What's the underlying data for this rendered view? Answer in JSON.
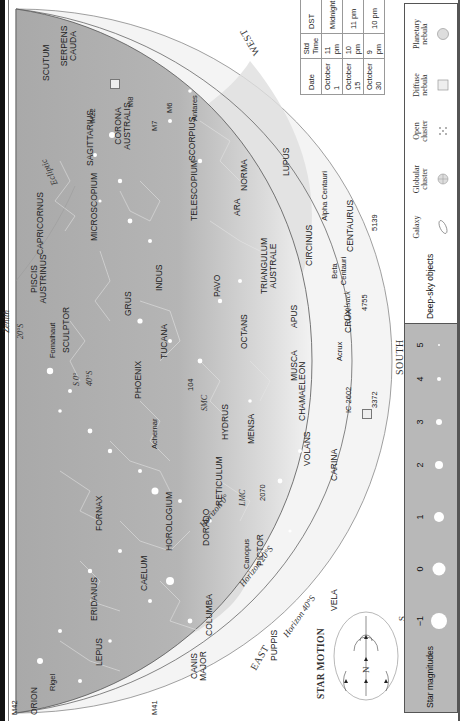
{
  "chart": {
    "directions": {
      "west": "WEST",
      "east": "EAST",
      "south": "SOUTH",
      "zenith": "Zenith"
    },
    "horizons": [
      "Horizon 0°",
      "Horizon 20°S",
      "Horizon 40°S"
    ],
    "zenith_marks": [
      "20°S",
      "40°S",
      "S 0°"
    ],
    "ecliptic": "Ecliptic",
    "constellations": [
      "SCUTUM",
      "SERPENS CAUDA",
      "SAGITTARIUS",
      "CORONA AUSTRALIS",
      "SCORPIUS",
      "CAPRICORNUS",
      "MICROSCOPIUM",
      "TELESCOPIUM",
      "PISCIS AUSTRINUS",
      "INDUS",
      "ARA",
      "NORMA",
      "LUPUS",
      "GRUS",
      "PAVO",
      "SCULPTOR",
      "TUCANA",
      "OCTANS",
      "TRIANGULUM AUSTRALE",
      "CIRCINUS",
      "PHOENIX",
      "APUS",
      "CENTAURUS",
      "HYDRUS",
      "MENSA",
      "CHAMAELEON",
      "MUSCA",
      "CRUX",
      "FORNAX",
      "HOROLOGIUM",
      "RETICULUM",
      "DORADO",
      "VOLANS",
      "CARINA",
      "ERIDANUS",
      "CAELUM",
      "PICTOR",
      "LEPUS",
      "COLUMBA",
      "VELA",
      "ORION",
      "PUPPIS",
      "CANIS MAJOR"
    ],
    "stars": [
      "Antares",
      "Fomalhaut",
      "Achernar",
      "Canopus",
      "Rigel",
      "Alpha Centauri",
      "Beta Centauri",
      "Acrux"
    ],
    "objects": [
      "M8",
      "M22",
      "M7",
      "M6",
      "104",
      "SMC",
      "LMC",
      "2070",
      "IC 2602",
      "3372",
      "4755",
      "5139",
      "Coalsack",
      "M42",
      "M41"
    ]
  },
  "time_table": {
    "headers": [
      "Date",
      "Std Time",
      "DST"
    ],
    "rows": [
      [
        "October 1",
        "11 pm",
        "Midnight"
      ],
      [
        "October 15",
        "10 pm",
        "11 pm"
      ],
      [
        "October 30",
        "9 pm",
        "10 pm"
      ]
    ]
  },
  "star_motion": {
    "title": "STAR MOTION",
    "north": "N",
    "south": "S"
  },
  "legend": {
    "magnitudes_title": "Star magnitudes",
    "magnitudes": [
      "−1",
      "0",
      "1",
      "2",
      "3",
      "4",
      "5"
    ],
    "deep_sky_title": "Deep-sky objects",
    "deep_sky": [
      "Galaxy",
      "Globular cluster",
      "Open cluster",
      "Diffuse nebula",
      "Planetary nebula"
    ]
  }
}
